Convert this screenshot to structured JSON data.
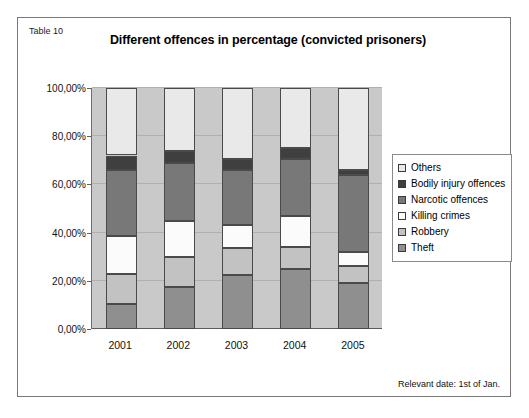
{
  "figure": {
    "table_label": "Table 10",
    "footnote": "Relevant date: 1st of Jan."
  },
  "chart_data": {
    "type": "bar",
    "stacked": true,
    "normalized": true,
    "title": "Different offences in percentage (convicted prisoners)",
    "xlabel": "",
    "ylabel": "",
    "categories": [
      "2001",
      "2002",
      "2003",
      "2004",
      "2005"
    ],
    "ylim": [
      0,
      100
    ],
    "ytick_values": [
      0,
      20,
      40,
      60,
      80,
      100
    ],
    "ytick_labels": [
      "0,00%",
      "20,00%",
      "40,00%",
      "60,00%",
      "80,00%",
      "100,00%"
    ],
    "grid": true,
    "legend_position": "right",
    "stack_order_bottom_to_top": [
      "Theft",
      "Robbery",
      "Killing crimes",
      "Narcotic offences",
      "Bodily injury offences",
      "Others"
    ],
    "series": [
      {
        "name": "Theft",
        "color": "#8f8f8f",
        "values": [
          10.5,
          17.5,
          22.5,
          25.0,
          19.0
        ]
      },
      {
        "name": "Robbery",
        "color": "#c2c2c2",
        "values": [
          12.5,
          12.5,
          11.0,
          9.0,
          7.0
        ]
      },
      {
        "name": "Killing crimes",
        "color": "#fbfbfb",
        "values": [
          15.5,
          15.0,
          9.5,
          13.0,
          6.0
        ]
      },
      {
        "name": "Narcotic offences",
        "color": "#787878",
        "values": [
          27.5,
          24.0,
          23.0,
          23.5,
          32.0
        ]
      },
      {
        "name": "Bodily injury offences",
        "color": "#3f3f3f",
        "values": [
          6.0,
          5.0,
          4.5,
          4.5,
          2.0
        ]
      },
      {
        "name": "Others",
        "color": "#e9e9e9",
        "values": [
          28.0,
          26.0,
          29.5,
          25.0,
          34.0
        ]
      }
    ],
    "cumulative_tops": {
      "2001": {
        "Theft": 10.5,
        "Robbery": 23.0,
        "Killing crimes": 38.5,
        "Narcotic offences": 66.0,
        "Bodily injury offences": 72.0,
        "Others": 100.0
      },
      "2002": {
        "Theft": 17.5,
        "Robbery": 30.0,
        "Killing crimes": 45.0,
        "Narcotic offences": 69.0,
        "Bodily injury offences": 74.0,
        "Others": 100.0
      },
      "2003": {
        "Theft": 22.5,
        "Robbery": 33.5,
        "Killing crimes": 43.0,
        "Narcotic offences": 66.0,
        "Bodily injury offences": 70.5,
        "Others": 100.0
      },
      "2004": {
        "Theft": 25.0,
        "Robbery": 34.0,
        "Killing crimes": 47.0,
        "Narcotic offences": 70.5,
        "Bodily injury offences": 75.0,
        "Others": 100.0
      },
      "2005": {
        "Theft": 19.0,
        "Robbery": 26.0,
        "Killing crimes": 32.0,
        "Narcotic offences": 64.0,
        "Bodily injury offences": 66.0,
        "Others": 100.0
      }
    },
    "legend_entries": [
      {
        "label": "Others",
        "color": "#e9e9e9"
      },
      {
        "label": "Bodily injury offences",
        "color": "#3f3f3f"
      },
      {
        "label": "Narcotic offences",
        "color": "#787878"
      },
      {
        "label": "Killing crimes",
        "color": "#fbfbfb"
      },
      {
        "label": "Robbery",
        "color": "#c2c2c2"
      },
      {
        "label": "Theft",
        "color": "#8f8f8f"
      }
    ],
    "plot_background": "#c9c9c9"
  }
}
